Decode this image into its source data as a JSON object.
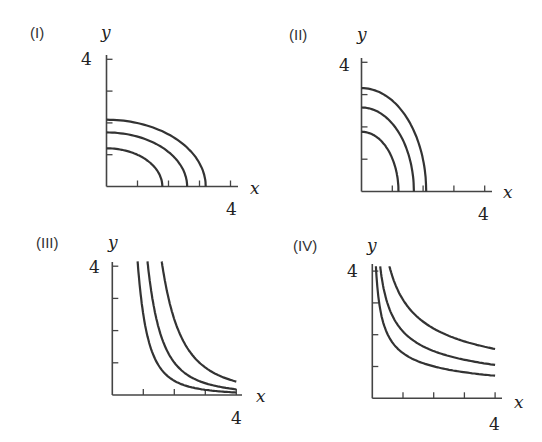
{
  "figure": {
    "panels": [
      {
        "id": "I",
        "label": "(I)",
        "x_label": "x",
        "y_label": "y",
        "x_tick_label": "4",
        "y_tick_label": "4"
      },
      {
        "id": "II",
        "label": "(II)",
        "x_label": "x",
        "y_label": "y",
        "x_tick_label": "4",
        "y_tick_label": "4"
      },
      {
        "id": "III",
        "label": "(III)",
        "x_label": "x",
        "y_label": "y",
        "x_tick_label": "4",
        "y_tick_label": "4"
      },
      {
        "id": "IV",
        "label": "(IV)",
        "x_label": "x",
        "y_label": "y",
        "x_tick_label": "4",
        "y_tick_label": "4"
      }
    ]
  },
  "chart_data": [
    {
      "type": "line",
      "title": "(I)",
      "xlabel": "x",
      "ylabel": "y",
      "xlim": [
        0,
        4
      ],
      "ylim": [
        0,
        4
      ],
      "x_ticks": [
        1,
        2,
        3,
        4
      ],
      "y_ticks": [
        1,
        2,
        3,
        4
      ],
      "tick_labels_shown": {
        "x": [
          "4"
        ],
        "y": [
          "4"
        ]
      },
      "grid": false,
      "description": "Three concentric quarter-ellipses, wider than tall",
      "series": [
        {
          "name": "curve 1",
          "shape": "quarter-ellipse",
          "x_intercept": 1.8,
          "y_intercept": 1.2
        },
        {
          "name": "curve 2",
          "shape": "quarter-ellipse",
          "x_intercept": 2.6,
          "y_intercept": 1.7
        },
        {
          "name": "curve 3",
          "shape": "quarter-ellipse",
          "x_intercept": 3.2,
          "y_intercept": 2.1
        }
      ]
    },
    {
      "type": "line",
      "title": "(II)",
      "xlabel": "x",
      "ylabel": "y",
      "xlim": [
        0,
        4
      ],
      "ylim": [
        0,
        4
      ],
      "x_ticks": [
        1,
        2,
        3,
        4
      ],
      "y_ticks": [
        1,
        2,
        3,
        4
      ],
      "tick_labels_shown": {
        "x": [
          "4"
        ],
        "y": [
          "4"
        ]
      },
      "grid": false,
      "description": "Three concentric quarter-ellipses, taller than wide",
      "series": [
        {
          "name": "curve 1",
          "shape": "quarter-ellipse",
          "x_intercept": 1.2,
          "y_intercept": 1.85
        },
        {
          "name": "curve 2",
          "shape": "quarter-ellipse",
          "x_intercept": 1.7,
          "y_intercept": 2.6
        },
        {
          "name": "curve 3",
          "shape": "quarter-ellipse",
          "x_intercept": 2.1,
          "y_intercept": 3.2
        }
      ]
    },
    {
      "type": "line",
      "title": "(III)",
      "xlabel": "x",
      "ylabel": "y",
      "xlim": [
        0,
        4
      ],
      "ylim": [
        0,
        4
      ],
      "x_ticks": [
        1,
        2,
        3,
        4
      ],
      "y_ticks": [
        1,
        2,
        3,
        4
      ],
      "tick_labels_shown": {
        "x": [
          "4"
        ],
        "y": [
          "4"
        ]
      },
      "grid": false,
      "description": "Three steep decreasing hyperbola-like curves (y ~ k/x^2.5)",
      "series": [
        {
          "name": "curve 1",
          "shape": "power",
          "k": 2.5,
          "p": 2.5,
          "x": [
            0.82,
            1,
            1.5,
            2,
            3,
            4
          ],
          "y": [
            4.1,
            2.5,
            0.91,
            0.44,
            0.16,
            0.08
          ]
        },
        {
          "name": "curve 2",
          "shape": "power",
          "k": 5.7,
          "p": 2.5,
          "x": [
            1.14,
            1.5,
            2,
            3,
            4
          ],
          "y": [
            4.1,
            2.07,
            1.01,
            0.37,
            0.18
          ]
        },
        {
          "name": "curve 3",
          "shape": "power",
          "k": 13.3,
          "p": 2.5,
          "x": [
            1.6,
            2,
            2.5,
            3,
            4
          ],
          "y": [
            4.1,
            2.35,
            1.35,
            0.85,
            0.42
          ]
        }
      ]
    },
    {
      "type": "line",
      "title": "(IV)",
      "xlabel": "x",
      "ylabel": "y",
      "xlim": [
        0,
        4
      ],
      "ylim": [
        0,
        4
      ],
      "x_ticks": [
        1,
        2,
        3,
        4
      ],
      "y_ticks": [
        1,
        2,
        3,
        4
      ],
      "tick_labels_shown": {
        "x": [
          "4"
        ],
        "y": [
          "4"
        ]
      },
      "grid": false,
      "description": "Three gently decreasing curves (y ~ k/sqrt(x))",
      "series": [
        {
          "name": "curve 1",
          "shape": "power",
          "k": 1.42,
          "p": 0.5,
          "x": [
            0.13,
            0.5,
            1,
            2,
            3,
            4
          ],
          "y": [
            4.0,
            2.0,
            1.42,
            1.0,
            0.82,
            0.71
          ]
        },
        {
          "name": "curve 2",
          "shape": "power",
          "k": 2.1,
          "p": 0.5,
          "x": [
            0.28,
            0.5,
            1,
            2,
            3,
            4
          ],
          "y": [
            4.0,
            2.97,
            2.1,
            1.48,
            1.21,
            1.05
          ]
        },
        {
          "name": "curve 3",
          "shape": "power",
          "k": 3.1,
          "p": 0.5,
          "x": [
            0.6,
            1,
            2,
            3,
            4
          ],
          "y": [
            4.0,
            3.1,
            2.19,
            1.79,
            1.55
          ]
        }
      ]
    }
  ]
}
